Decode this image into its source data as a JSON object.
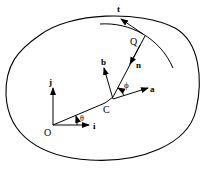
{
  "diagram": {
    "colors": {
      "stroke": "#000000",
      "background": "#ffffff"
    },
    "labels": {
      "origin": "O",
      "i": "i",
      "j": "j",
      "theta": "θ",
      "center": "C",
      "a": "a",
      "b": "b",
      "phi": "ϕ",
      "n": "n",
      "contact": "Q",
      "t": "t"
    },
    "points": {
      "O": [
        53,
        125
      ],
      "C": [
        105,
        103
      ],
      "Q": [
        143,
        37
      ]
    }
  }
}
